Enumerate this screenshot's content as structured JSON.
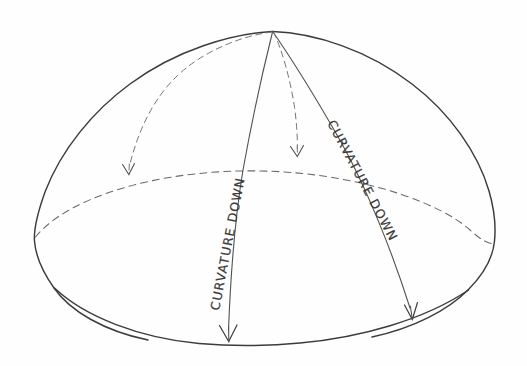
{
  "figure": {
    "background_color": "#fefefe",
    "ink_color": "#3c3c3c",
    "dashed_ink_color": "#6a6a68"
  },
  "labels": {
    "left_meridian": "CURVATURE DOWN",
    "right_meridian": "CURVATURE DOWN"
  },
  "geometry": {
    "apex": "272,32",
    "left_rim": "35,240",
    "right_rim": "494,243",
    "base_low_point": "250,345",
    "left_arrow_tip": "128,174",
    "middle_arrow_tip": "297,156",
    "center_arrow_tip": "228,341",
    "right_arrow_tip": "412,319"
  },
  "annotations": {
    "dome_outline": "solid dome silhouette",
    "equator": "dashed ellipse across the dome",
    "meridian_center": "solid curve apex to base with arrow",
    "meridian_right": "solid curve apex to base with arrow",
    "dashed_arc_left": "dashed arc apex to equator with arrow",
    "dashed_arc_middle": "dashed arc apex to equator with arrow"
  }
}
